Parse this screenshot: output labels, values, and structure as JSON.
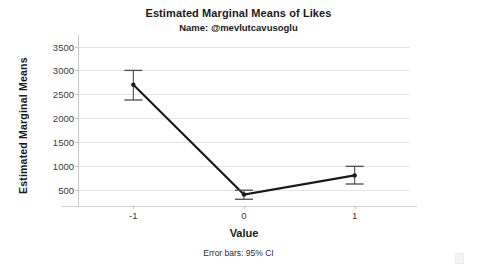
{
  "chart_data": {
    "type": "line",
    "title": "Estimated Marginal Means of Likes",
    "subtitle": "Name: @mevlutcavusoglu",
    "xlabel": "Value",
    "ylabel": "Estimated Marginal Means",
    "footnote": "Error bars: 95% CI",
    "categories": [
      "-1",
      "0",
      "1"
    ],
    "x_tick_labels": [
      "-1",
      "0",
      "1"
    ],
    "y_tick_labels": [
      "500",
      "1000",
      "1500",
      "2000",
      "2500",
      "3000",
      "3500"
    ],
    "y_ticks": [
      500,
      1000,
      1500,
      2000,
      2500,
      3000,
      3500
    ],
    "ylim": [
      180,
      3700
    ],
    "grid": true,
    "legend": "none",
    "error_bar_type": "95% CI",
    "series": [
      {
        "name": "Estimated Marginal Means",
        "values": [
          2700,
          400,
          800
        ],
        "ci_lower": [
          2380,
          300,
          620
        ],
        "ci_upper": [
          3000,
          490,
          990
        ],
        "color": "#1a1a1a"
      }
    ]
  },
  "style": {
    "line_color": "#1a1a1a",
    "marker_color": "#1a1a1a",
    "error_bar_color": "#4d4d4d",
    "gridline_color": "#e6e6e6",
    "axis_color": "#c9c9c9",
    "background": "#ffffff",
    "text_color": "#1a1a1a"
  }
}
